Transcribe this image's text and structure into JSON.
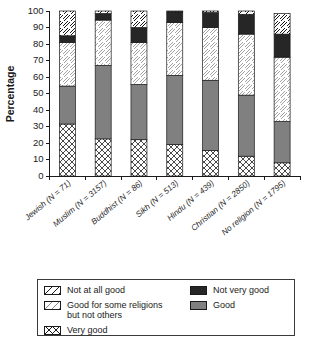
{
  "chart_data": {
    "type": "bar",
    "subtype": "stacked-bar-100",
    "title": "",
    "xlabel": "",
    "ylabel": "Percentage",
    "ylim": [
      0,
      100
    ],
    "yticks": [
      0,
      10,
      20,
      30,
      40,
      50,
      60,
      70,
      80,
      90,
      100
    ],
    "ytick_labels": [
      "0",
      "10",
      "20",
      "30",
      "40",
      "50",
      "60",
      "70",
      "80",
      "90",
      "100"
    ],
    "grid": false,
    "legend_position": "below-plot",
    "categories": [
      "Jewish (N = 71)",
      "Muslim (N = 3157)",
      "Buddhist (N = 86)",
      "Sikh (N = 513)",
      "Hindu (N = 439)",
      "Christian (N = 2850)",
      "No religion (N = 1795)"
    ],
    "series": [
      {
        "name": "Very good",
        "pattern": "crosshatch",
        "color": "#ffffff",
        "values": [
          31.5,
          22.5,
          22.0,
          19.0,
          15.5,
          12.0,
          8.0
        ]
      },
      {
        "name": "Good",
        "pattern": "solid-gray",
        "color": "#808080",
        "values": [
          23.0,
          44.5,
          33.5,
          42.0,
          42.5,
          37.0,
          25.0
        ]
      },
      {
        "name": "Good for some religions but not others",
        "pattern": "light-hatch",
        "color": "#ffffff",
        "values": [
          26.5,
          27.5,
          25.5,
          32.0,
          32.0,
          37.0,
          39.0
        ]
      },
      {
        "name": "Not very good",
        "pattern": "solid-black",
        "color": "#262626",
        "values": [
          4.0,
          4.0,
          9.0,
          6.5,
          9.0,
          12.0,
          14.0
        ]
      },
      {
        "name": "Not at all good",
        "pattern": "diagonal-hatch",
        "color": "#ffffff",
        "values": [
          15.0,
          1.5,
          10.0,
          0.5,
          1.0,
          2.0,
          12.5
        ]
      }
    ],
    "legend_entries": [
      {
        "label": "Not at all good",
        "pattern": "diagonal-hatch",
        "column": "left"
      },
      {
        "label": "Good for some religions\nbut not others",
        "pattern": "light-hatch",
        "column": "left"
      },
      {
        "label": "Very good",
        "pattern": "crosshatch",
        "column": "left"
      },
      {
        "label": "Not very good",
        "pattern": "solid-black",
        "column": "right"
      },
      {
        "label": "Good",
        "pattern": "solid-gray",
        "column": "right"
      }
    ]
  },
  "colors": {
    "gray_fill": "#808080",
    "black_fill": "#262626",
    "outline": "#1a1a1a",
    "background": "#ffffff"
  }
}
